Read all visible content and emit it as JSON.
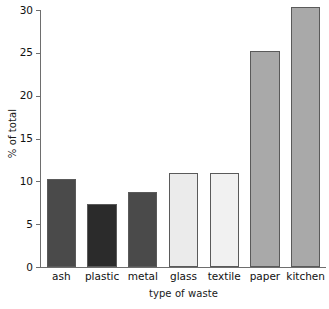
{
  "chart_data": {
    "type": "bar",
    "title": "",
    "subtitle": "",
    "xlabel": "type of waste",
    "ylabel": "% of total",
    "categories": [
      "ash",
      "plastic",
      "metal",
      "glass",
      "textile",
      "paper",
      "kitchen"
    ],
    "values": [
      10.3,
      7.3,
      8.7,
      11.0,
      11.0,
      25.2,
      30.3
    ],
    "series": [
      {
        "name": "% of total",
        "values": [
          10.3,
          7.3,
          8.7,
          11.0,
          11.0,
          25.2,
          30.3
        ]
      }
    ],
    "bar_colors": [
      "#4a4a4a",
      "#2b2b2b",
      "#4a4a4a",
      "#ebebeb",
      "#f1f1f1",
      "#a9a9a9",
      "#a9a9a9"
    ],
    "bar_edge_color": "#5a5a5a",
    "ylim": [
      0,
      30
    ],
    "yticks": [
      0,
      5,
      10,
      15,
      20,
      25,
      30
    ],
    "ytick_labels": [
      "0",
      "5",
      "10",
      "15",
      "20",
      "25",
      "30"
    ],
    "xlim": [
      0,
      7
    ],
    "grid": false,
    "legend": null,
    "legend_position": "none",
    "annotations": [],
    "axis_color": "#6e6e6e",
    "background_color": "#ffffff",
    "text_color": "#111111"
  }
}
